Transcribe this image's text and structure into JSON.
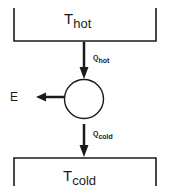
{
  "diagram": {
    "type": "heat-engine-schematic",
    "hot_reservoir": {
      "symbol": "T",
      "subscript": "hot"
    },
    "cold_reservoir": {
      "symbol": "T",
      "subscript": "cold"
    },
    "heat_in": {
      "symbol": "Q",
      "subscript": "hot"
    },
    "heat_out": {
      "symbol": "Q",
      "subscript": "cold"
    },
    "work_out": {
      "symbol": "E"
    },
    "colors": {
      "line": "#1a1a1a",
      "background": "#ffffff"
    }
  }
}
